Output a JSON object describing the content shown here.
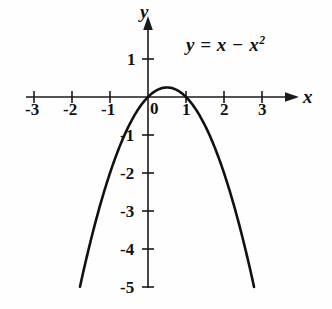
{
  "chart_data": {
    "type": "line",
    "title": "",
    "equation_label": "y = x − x²",
    "equation_parts": {
      "lhs": "y",
      "equals": "=",
      "term1": "x",
      "minus": "−",
      "term2_base": "x",
      "term2_exponent": "2"
    },
    "xlabel": "x",
    "ylabel": "y",
    "xlim": [
      -3.4,
      3.6
    ],
    "ylim": [
      -5.3,
      1.6
    ],
    "grid": false,
    "legend": "none",
    "axis_arrows": [
      "x-positive",
      "y-positive"
    ],
    "origin_label": "0",
    "xticks": [
      -3,
      -2,
      -1,
      1,
      2,
      3
    ],
    "xtick_labels": [
      "-3",
      "-2",
      "-1",
      "1",
      "2",
      "3"
    ],
    "yticks": [
      1,
      -1,
      -2,
      -3,
      -4,
      -5
    ],
    "ytick_labels": [
      "1",
      "-1",
      "-2",
      "-3",
      "-4",
      "-5"
    ],
    "roots": [
      0,
      1
    ],
    "vertex": [
      0.5,
      0.25
    ],
    "x": [
      -1.79,
      -1.6,
      -1.4,
      -1.2,
      -1.0,
      -0.8,
      -0.6,
      -0.4,
      -0.2,
      0.0,
      0.2,
      0.4,
      0.5,
      0.6,
      0.8,
      1.0,
      1.2,
      1.4,
      1.6,
      1.8,
      2.0,
      2.2,
      2.4,
      2.6,
      2.79
    ],
    "values": [
      -5.0,
      -4.16,
      -3.36,
      -2.64,
      -2.0,
      -1.44,
      -0.96,
      -0.56,
      -0.24,
      0.0,
      0.16,
      0.24,
      0.25,
      0.24,
      0.16,
      0.0,
      -0.24,
      -0.56,
      -0.96,
      -1.44,
      -2.0,
      -2.64,
      -3.36,
      -4.16,
      -5.0
    ],
    "curve_color": "#111111",
    "axis_color": "#1a1a1a",
    "background_color": "#fefefe"
  }
}
